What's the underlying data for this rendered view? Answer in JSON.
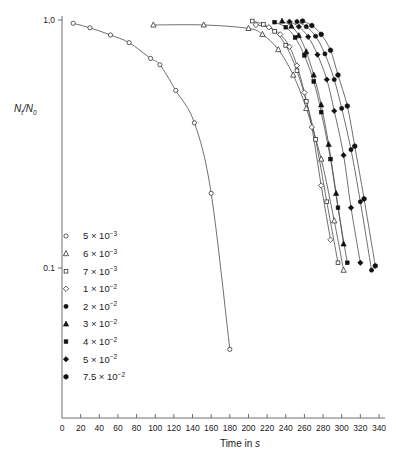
{
  "chart_data": {
    "type": "line",
    "title": "",
    "xlabel": "Time in s",
    "ylabel": "Nt/N0",
    "ylabel_parts": {
      "num_base": "N",
      "num_sub": "t",
      "slash": "/",
      "den_base": "N",
      "den_sub": "0"
    },
    "yscale": "log",
    "ylim": [
      0.035,
      1.08
    ],
    "xlim": [
      0,
      345
    ],
    "grid": false,
    "legend_position": "lower-left-inside",
    "xticks": [
      0,
      20,
      40,
      60,
      80,
      100,
      120,
      140,
      160,
      180,
      200,
      220,
      240,
      260,
      280,
      300,
      320,
      340
    ],
    "xtick_labels": [
      "0",
      "20",
      "40",
      "60",
      "80",
      "100",
      "120",
      "140",
      "160",
      "180",
      "200",
      "220",
      "240",
      "260",
      "280",
      "300",
      "320",
      "340"
    ],
    "yticks": [
      1.0,
      0.1
    ],
    "ytick_labels": [
      "1,0",
      "0.1"
    ],
    "series": [
      {
        "name": "5 x 10^-3",
        "label_mantissa": "5",
        "label_times": "×",
        "label_base": "10",
        "label_exponent": "−3",
        "marker": "open-circle",
        "x": [
          12,
          30,
          52,
          72,
          95,
          105,
          122,
          142,
          160,
          180
        ],
        "y": [
          0.97,
          0.93,
          0.87,
          0.81,
          0.7,
          0.66,
          0.52,
          0.385,
          0.2,
          0.047
        ]
      },
      {
        "name": "6 x 10^-3",
        "label_mantissa": "6",
        "label_times": "×",
        "label_base": "10",
        "label_exponent": "−3",
        "marker": "open-triangle",
        "x": [
          98,
          152,
          200,
          215,
          232,
          248,
          262,
          278,
          292,
          302
        ],
        "y": [
          0.955,
          0.955,
          0.925,
          0.875,
          0.76,
          0.6,
          0.44,
          0.275,
          0.155,
          0.098
        ]
      },
      {
        "name": "7 x 10^-3",
        "label_mantissa": "7",
        "label_times": "×",
        "label_base": "10",
        "label_exponent": "−3",
        "marker": "open-square",
        "x": [
          204,
          216,
          228,
          240,
          252,
          262,
          272,
          284,
          296
        ],
        "y": [
          0.99,
          0.96,
          0.9,
          0.79,
          0.625,
          0.47,
          0.33,
          0.185,
          0.105
        ]
      },
      {
        "name": "1 x 10^-2",
        "label_mantissa": "1",
        "label_times": "×",
        "label_base": "10",
        "label_exponent": "−2",
        "marker": "open-diamond",
        "x": [
          208,
          222,
          234,
          244,
          252,
          260,
          268,
          278,
          288
        ],
        "y": [
          0.955,
          0.935,
          0.875,
          0.78,
          0.655,
          0.51,
          0.37,
          0.215,
          0.13
        ]
      },
      {
        "name": "2 x 10^-2",
        "label_mantissa": "2",
        "label_times": "×",
        "label_base": "10",
        "label_exponent": "−2",
        "marker": "filled-circle",
        "x": [
          252,
          262,
          272,
          282,
          292,
          300,
          310,
          320,
          332
        ],
        "y": [
          0.985,
          0.94,
          0.86,
          0.73,
          0.575,
          0.44,
          0.3,
          0.185,
          0.098
        ]
      },
      {
        "name": "3 x 10^-2",
        "label_mantissa": "3",
        "label_times": "×",
        "label_base": "10",
        "label_exponent": "−2",
        "marker": "filled-triangle",
        "x": [
          236,
          246,
          254,
          262,
          270,
          278,
          286,
          294,
          302
        ],
        "y": [
          0.99,
          0.945,
          0.865,
          0.745,
          0.6,
          0.455,
          0.315,
          0.2,
          0.125
        ]
      },
      {
        "name": "4 x 10^-2",
        "label_mantissa": "4",
        "label_times": "×",
        "label_base": "10",
        "label_exponent": "−2",
        "marker": "filled-square",
        "x": [
          228,
          240,
          250,
          260,
          270,
          278,
          288,
          296,
          306
        ],
        "y": [
          0.98,
          0.935,
          0.85,
          0.72,
          0.565,
          0.425,
          0.275,
          0.175,
          0.105
        ]
      },
      {
        "name": "5 x 10^-2",
        "label_mantissa": "5",
        "label_times": "×",
        "label_base": "10",
        "label_exponent": "−2",
        "marker": "filled-diamond",
        "x": [
          244,
          254,
          264,
          274,
          284,
          292,
          302,
          310,
          320
        ],
        "y": [
          0.985,
          0.94,
          0.855,
          0.725,
          0.575,
          0.43,
          0.285,
          0.175,
          0.105
        ]
      },
      {
        "name": "7.5 x 10^-2",
        "label_mantissa": "7.5",
        "label_times": "×",
        "label_base": "10",
        "label_exponent": "−2",
        "marker": "filled-hexagon",
        "x": [
          258,
          268,
          278,
          288,
          296,
          306,
          314,
          324,
          336
        ],
        "y": [
          0.99,
          0.95,
          0.875,
          0.755,
          0.6,
          0.45,
          0.31,
          0.19,
          0.102
        ]
      }
    ]
  }
}
